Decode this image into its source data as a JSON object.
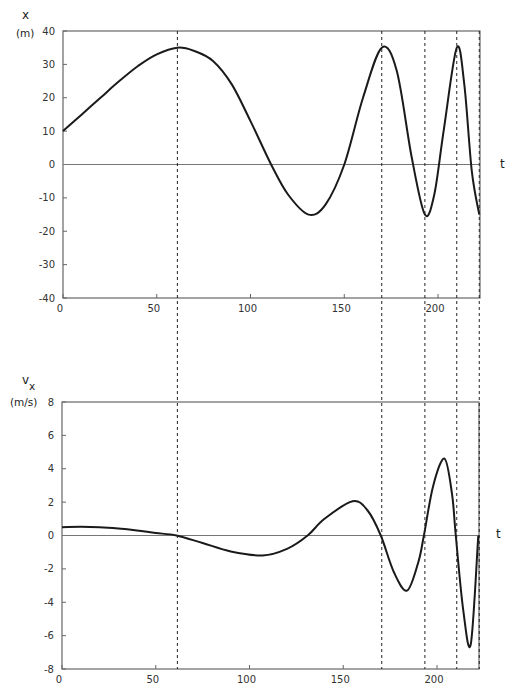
{
  "chart_data": [
    {
      "type": "line",
      "title": "",
      "ylabel": "x",
      "yunit": "(m)",
      "xlabel": "t",
      "xlim": [
        0,
        223
      ],
      "ylim": [
        -40,
        40
      ],
      "x_ticks": [
        0,
        50,
        100,
        150,
        200
      ],
      "x_tick_labels": [
        "0",
        "50",
        "100",
        "150",
        "200"
      ],
      "y_ticks": [
        40,
        30,
        20,
        10,
        0,
        -10,
        -20,
        -30,
        -40
      ],
      "y_tick_labels": [
        "40",
        "30",
        "20",
        "10",
        "0",
        "-10",
        "-20",
        "-30",
        "-40"
      ],
      "grid": false,
      "zero_line": true,
      "series": [
        {
          "name": "x(t)",
          "x": [
            0,
            10,
            20,
            30,
            40,
            50,
            61,
            70,
            80,
            90,
            100,
            111,
            120,
            131,
            140,
            150,
            160,
            170,
            178,
            186,
            193,
            198,
            203,
            210,
            214,
            218,
            222
          ],
          "values": [
            10,
            15,
            20,
            25,
            29.5,
            33,
            35,
            34,
            31,
            24,
            13,
            0,
            -9,
            -15,
            -12,
            0,
            20,
            35,
            28,
            2,
            -15,
            -9,
            10,
            35,
            24,
            -2,
            -15
          ]
        }
      ],
      "annotations": {
        "dashed_verticals_t": [
          61,
          170,
          193,
          210,
          222
        ]
      }
    },
    {
      "type": "line",
      "title": "",
      "ylabel": "v_x",
      "yunit": "(m/s)",
      "xlabel": "t",
      "xlim": [
        0,
        223
      ],
      "ylim": [
        -8,
        8
      ],
      "x_ticks": [
        0,
        50,
        100,
        150,
        200
      ],
      "x_tick_labels": [
        "0",
        "50",
        "100",
        "150",
        "200"
      ],
      "y_ticks": [
        8,
        6,
        4,
        2,
        0,
        -2,
        -4,
        -6,
        -8
      ],
      "y_tick_labels": [
        "8",
        "6",
        "4",
        "2",
        "0",
        "-2",
        "-4",
        "-6",
        "-8"
      ],
      "grid": false,
      "zero_line": true,
      "series": [
        {
          "name": "v_x(t)",
          "x": [
            0,
            10,
            20,
            30,
            40,
            50,
            61,
            75,
            90,
            107,
            120,
            131,
            140,
            155,
            163,
            170,
            177,
            184,
            190,
            193,
            198,
            204,
            208,
            210,
            214,
            218,
            222
          ],
          "values": [
            0.5,
            0.52,
            0.5,
            0.42,
            0.3,
            0.15,
            0,
            -0.45,
            -0.95,
            -1.2,
            -0.8,
            0,
            1.0,
            2.05,
            1.5,
            0,
            -2.2,
            -3.3,
            -1.6,
            0,
            3.0,
            4.6,
            2.5,
            0,
            -4.5,
            -6.5,
            0
          ]
        }
      ],
      "annotations": {
        "dashed_verticals_t": [
          61,
          170,
          193,
          210,
          222
        ]
      }
    }
  ],
  "labels": {
    "top_y_symbol": "x",
    "top_y_unit": "(m)",
    "bottom_y_symbol": "v",
    "bottom_y_subscript": "x",
    "bottom_y_unit": "(m/s)",
    "t_label": "t"
  }
}
